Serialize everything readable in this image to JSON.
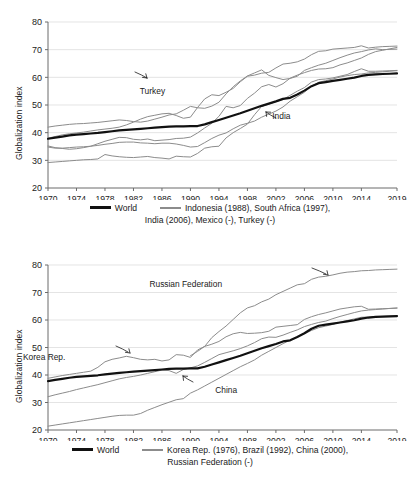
{
  "figure": {
    "panels": [
      {
        "id": "top",
        "ylabel": "Globalization index",
        "legend": {
          "world_label": "World",
          "group_line1": "Indonesia (1988), South Africa (1997),",
          "group_line2": "India (2006), Mexico (-), Turkey (-)"
        },
        "annotations": [
          {
            "text": "Turkey",
            "x": 1987.0,
            "y": 55.0
          },
          {
            "text": "India",
            "x": 2000.5,
            "y": 46.0
          }
        ]
      },
      {
        "id": "bottom",
        "ylabel": "Globalization index",
        "legend": {
          "world_label": "World",
          "group_line1": "Korea Rep. (1976), Brazil (1992), China (2000),",
          "group_line2": "Russian Federation (-)"
        },
        "annotations": [
          {
            "text": "Russian Federation",
            "x": 1995.0,
            "y": 73.0
          },
          {
            "text": "Korea Rep.",
            "x": 1973.0,
            "y": 46.5
          },
          {
            "text": "China",
            "x": 1992.5,
            "y": 34.5
          }
        ]
      }
    ]
  },
  "chart_data": [
    {
      "type": "line",
      "panel": "top",
      "title": "",
      "xlabel": "",
      "ylabel": "Globalization index",
      "xlim": [
        1970,
        2019
      ],
      "ylim": [
        20,
        80
      ],
      "yticks": [
        20,
        30,
        40,
        50,
        60,
        70,
        80
      ],
      "xticks": [
        1970,
        1974,
        1978,
        1982,
        1986,
        1990,
        1994,
        1998,
        2002,
        2006,
        2010,
        2014,
        2019
      ],
      "grid": "horizontal",
      "legend_position": "below",
      "x": [
        1970,
        1971,
        1972,
        1973,
        1974,
        1975,
        1976,
        1977,
        1978,
        1979,
        1980,
        1981,
        1982,
        1983,
        1984,
        1985,
        1986,
        1987,
        1988,
        1989,
        1990,
        1991,
        1992,
        1993,
        1994,
        1995,
        1996,
        1997,
        1998,
        1999,
        2000,
        2001,
        2002,
        2003,
        2004,
        2005,
        2006,
        2007,
        2008,
        2009,
        2010,
        2011,
        2012,
        2013,
        2014,
        2015,
        2016,
        2017,
        2018,
        2019
      ],
      "series": [
        {
          "name": "World",
          "color": "#111111",
          "width": 2.2,
          "values": [
            37.8,
            38.2,
            38.6,
            39.0,
            39.3,
            39.5,
            39.7,
            39.9,
            40.2,
            40.5,
            40.8,
            41.0,
            41.2,
            41.4,
            41.6,
            41.8,
            42.0,
            42.2,
            42.3,
            42.3,
            42.4,
            42.4,
            43.0,
            43.8,
            44.6,
            45.4,
            46.2,
            47.0,
            47.9,
            48.8,
            49.7,
            50.5,
            51.3,
            52.2,
            52.6,
            53.8,
            55.2,
            56.8,
            57.9,
            58.3,
            58.7,
            59.1,
            59.5,
            59.9,
            60.5,
            60.9,
            61.1,
            61.2,
            61.3,
            61.4
          ]
        },
        {
          "name": "Indonesia (1988)",
          "color": "#8c8c8c",
          "width": 1,
          "values": [
            29.2,
            29.4,
            29.6,
            29.8,
            30.0,
            30.2,
            30.3,
            30.5,
            32.1,
            31.6,
            31.3,
            31.1,
            31.0,
            31.2,
            31.4,
            31.0,
            30.8,
            30.5,
            31.5,
            31.3,
            31.2,
            32.5,
            34.4,
            34.9,
            35.1,
            38.1,
            40.0,
            41.5,
            43.1,
            46.5,
            49.5,
            50.3,
            51.2,
            52.0,
            53.5,
            55.0,
            56.3,
            58.3,
            59.2,
            59.4,
            59.8,
            60.4,
            61.0,
            62.1,
            63.1,
            62.2,
            62.2,
            62.3,
            62.4,
            62.5
          ]
        },
        {
          "name": "South Africa (1997)",
          "color": "#8c8c8c",
          "width": 1,
          "values": [
            35.2,
            34.6,
            34.3,
            34.0,
            34.2,
            34.6,
            35.1,
            36.0,
            36.9,
            37.6,
            38.3,
            38.2,
            37.6,
            37.4,
            37.7,
            37.1,
            37.3,
            37.5,
            37.9,
            38.0,
            38.4,
            39.9,
            41.7,
            43.4,
            45.9,
            49.5,
            49.0,
            49.8,
            52.4,
            54.3,
            56.6,
            57.4,
            56.5,
            57.7,
            59.7,
            60.8,
            61.7,
            62.5,
            63.0,
            63.1,
            63.5,
            64.5,
            65.2,
            66.1,
            67.0,
            68.3,
            69.3,
            69.8,
            70.3,
            70.8
          ]
        },
        {
          "name": "India (2006)",
          "color": "#8c8c8c",
          "width": 1,
          "values": [
            34.8,
            34.4,
            34.4,
            34.6,
            34.8,
            34.9,
            35.1,
            35.4,
            35.8,
            36.1,
            36.5,
            36.6,
            36.6,
            36.3,
            36.2,
            36.0,
            36.2,
            36.2,
            35.9,
            35.4,
            34.8,
            35.0,
            36.4,
            37.9,
            39.1,
            39.9,
            41.4,
            42.7,
            43.4,
            44.2,
            45.6,
            46.7,
            47.8,
            49.3,
            51.4,
            53.0,
            54.6,
            56.8,
            58.2,
            58.8,
            59.4,
            60.1,
            60.6,
            61.0,
            61.2,
            61.6,
            61.8,
            62.0,
            62.2,
            62.4
          ]
        },
        {
          "name": "Mexico (-)",
          "color": "#8c8c8c",
          "width": 1,
          "values": [
            42.0,
            42.4,
            42.7,
            43.0,
            43.2,
            43.3,
            43.5,
            43.7,
            44.0,
            44.3,
            44.6,
            44.4,
            44.0,
            43.8,
            44.2,
            44.9,
            45.6,
            46.4,
            46.8,
            48.1,
            49.5,
            49.0,
            48.8,
            49.6,
            51.0,
            54.0,
            56.6,
            58.7,
            60.5,
            61.6,
            62.7,
            60.7,
            59.9,
            59.2,
            59.6,
            60.4,
            62.5,
            63.5,
            64.4,
            65.1,
            66.1,
            67.1,
            68.0,
            68.8,
            69.3,
            69.9,
            70.3,
            70.0,
            70.1,
            70.2
          ]
        },
        {
          "name": "Turkey (-)",
          "color": "#8c8c8c",
          "width": 1,
          "values": [
            38.0,
            38.6,
            39.2,
            39.6,
            39.9,
            40.2,
            40.6,
            41.0,
            41.3,
            41.6,
            42.0,
            42.8,
            43.8,
            44.9,
            45.8,
            46.3,
            46.8,
            47.0,
            46.2,
            45.2,
            45.6,
            49.1,
            52.2,
            53.7,
            53.4,
            54.6,
            56.0,
            58.4,
            60.4,
            60.8,
            61.5,
            61.8,
            63.4,
            64.8,
            65.1,
            65.6,
            66.6,
            68.2,
            69.4,
            69.6,
            70.2,
            70.4,
            70.6,
            70.8,
            71.4,
            70.6,
            70.9,
            71.1,
            71.2,
            71.3
          ]
        }
      ]
    },
    {
      "type": "line",
      "panel": "bottom",
      "title": "",
      "xlabel": "",
      "ylabel": "Globalization index",
      "xlim": [
        1970,
        2019
      ],
      "ylim": [
        20,
        80
      ],
      "yticks": [
        20,
        30,
        40,
        50,
        60,
        70,
        80
      ],
      "xticks": [
        1970,
        1974,
        1978,
        1982,
        1986,
        1990,
        1994,
        1998,
        2002,
        2006,
        2010,
        2014,
        2019
      ],
      "grid": "horizontal",
      "legend_position": "below",
      "x": [
        1970,
        1971,
        1972,
        1973,
        1974,
        1975,
        1976,
        1977,
        1978,
        1979,
        1980,
        1981,
        1982,
        1983,
        1984,
        1985,
        1986,
        1987,
        1988,
        1989,
        1990,
        1991,
        1992,
        1993,
        1994,
        1995,
        1996,
        1997,
        1998,
        1999,
        2000,
        2001,
        2002,
        2003,
        2004,
        2005,
        2006,
        2007,
        2008,
        2009,
        2010,
        2011,
        2012,
        2013,
        2014,
        2015,
        2016,
        2017,
        2018,
        2019
      ],
      "series": [
        {
          "name": "World",
          "color": "#111111",
          "width": 2.2,
          "values": [
            37.8,
            38.2,
            38.6,
            39.0,
            39.3,
            39.5,
            39.7,
            39.9,
            40.2,
            40.5,
            40.8,
            41.0,
            41.2,
            41.4,
            41.6,
            41.8,
            42.0,
            42.2,
            42.3,
            42.3,
            42.4,
            42.4,
            43.0,
            43.8,
            44.6,
            45.4,
            46.2,
            47.0,
            47.9,
            48.8,
            49.7,
            50.5,
            51.3,
            52.2,
            52.6,
            53.8,
            55.2,
            56.8,
            57.9,
            58.3,
            58.7,
            59.1,
            59.5,
            59.9,
            60.5,
            60.9,
            61.1,
            61.2,
            61.3,
            61.4
          ]
        },
        {
          "name": "Korea Rep. (1976)",
          "color": "#8c8c8c",
          "width": 1,
          "values": [
            38.8,
            39.3,
            39.8,
            40.2,
            40.6,
            41.0,
            41.4,
            42.8,
            44.8,
            45.7,
            46.2,
            46.8,
            46.3,
            45.7,
            45.5,
            45.7,
            45.1,
            45.5,
            47.4,
            47.2,
            46.4,
            49.1,
            50.4,
            51.2,
            52.2,
            53.9,
            55.0,
            55.5,
            55.1,
            55.2,
            55.4,
            55.9,
            57.4,
            57.7,
            58.0,
            58.3,
            60.2,
            61.2,
            62.0,
            62.6,
            63.3,
            64.0,
            64.4,
            64.8,
            65.0,
            63.9,
            64.0,
            64.1,
            64.2,
            64.3
          ]
        },
        {
          "name": "Brazil (1992)",
          "color": "#8c8c8c",
          "width": 1,
          "values": [
            32.1,
            32.8,
            33.4,
            34.0,
            34.7,
            35.3,
            35.9,
            36.5,
            37.2,
            37.9,
            38.6,
            39.1,
            39.5,
            40.0,
            40.6,
            41.2,
            41.8,
            41.6,
            40.6,
            42.0,
            42.6,
            43.3,
            44.6,
            46.0,
            47.4,
            48.1,
            48.8,
            49.6,
            50.6,
            51.8,
            53.2,
            53.8,
            53.7,
            54.5,
            55.5,
            56.4,
            57.6,
            58.4,
            59.1,
            59.6,
            60.5,
            61.3,
            62.0,
            62.7,
            63.3,
            63.6,
            63.8,
            64.0,
            64.2,
            64.4
          ]
        },
        {
          "name": "China (2000)",
          "color": "#8c8c8c",
          "width": 1,
          "values": [
            21.4,
            21.8,
            22.2,
            22.6,
            23.0,
            23.4,
            23.8,
            24.2,
            24.6,
            25.0,
            25.3,
            25.4,
            25.4,
            26.0,
            27.2,
            28.2,
            29.2,
            30.1,
            31.0,
            31.4,
            33.4,
            34.6,
            36.0,
            37.4,
            38.8,
            40.2,
            41.6,
            43.0,
            44.2,
            45.5,
            47.2,
            48.6,
            50.0,
            51.4,
            52.7,
            53.9,
            55.0,
            56.2,
            57.2,
            57.8,
            58.4,
            59.2,
            59.8,
            60.4,
            61.0,
            61.1,
            61.2,
            61.3,
            61.4,
            61.5
          ]
        },
        {
          "name": "Russian Federation (-)",
          "color": "#8c8c8c",
          "width": 1,
          "values": [
            null,
            null,
            null,
            null,
            null,
            null,
            null,
            null,
            null,
            null,
            null,
            null,
            null,
            null,
            null,
            null,
            null,
            null,
            null,
            null,
            47.0,
            48.6,
            50.4,
            53.6,
            55.8,
            57.8,
            60.2,
            62.6,
            64.4,
            65.2,
            66.6,
            67.6,
            69.2,
            70.4,
            71.6,
            72.8,
            73.2,
            74.8,
            75.6,
            75.9,
            76.4,
            77.0,
            77.4,
            77.6,
            77.9,
            78.0,
            78.2,
            78.3,
            78.4,
            78.5
          ]
        }
      ]
    }
  ]
}
